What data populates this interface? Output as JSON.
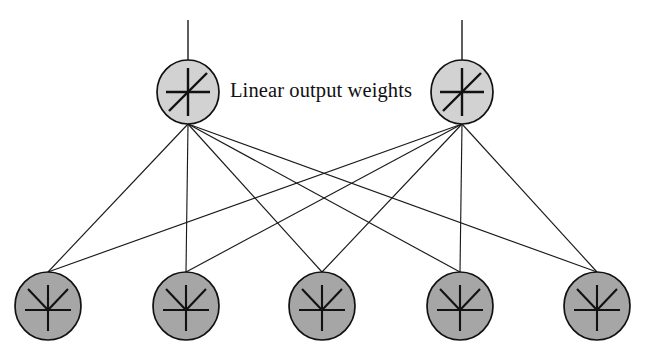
{
  "figure": {
    "title": "Linear output weights",
    "type": "neural-network-diagram",
    "background_color": "#ffffff",
    "line_color": "#1a1a1a"
  },
  "caption": {
    "label": "Linear output weights",
    "x": 230,
    "y": 97,
    "font_size_px": 20.5
  },
  "layers": [
    {
      "name": "output-layer",
      "role": "Linear output units",
      "glyph": "linear-activation-icon",
      "glyph_description": "cross with rising diagonal",
      "fill_color": "#d2d2d2",
      "stroke_color": "#111111",
      "radius_x": 31,
      "radius_y": 32,
      "center_y": 92,
      "nodes": [
        {
          "id": "out-1",
          "label": "",
          "cx": 188,
          "cy": 92
        },
        {
          "id": "out-2",
          "label": "",
          "cx": 462,
          "cy": 92
        }
      ]
    },
    {
      "name": "hidden-layer",
      "role": "Nonlinear basis function units",
      "glyph": "basis-function-icon",
      "glyph_description": "cross with V-shaped bump curve",
      "fill_color": "#a6a6a6",
      "stroke_color": "#111111",
      "radius_x": 33,
      "radius_y": 34,
      "center_y": 306,
      "nodes": [
        {
          "id": "hid-1",
          "label": "",
          "cx": 48,
          "cy": 306
        },
        {
          "id": "hid-2",
          "label": "",
          "cx": 186,
          "cy": 306
        },
        {
          "id": "hid-3",
          "label": "",
          "cx": 322,
          "cy": 306
        },
        {
          "id": "hid-4",
          "label": "",
          "cx": 460,
          "cy": 306
        },
        {
          "id": "hid-5",
          "label": "",
          "cx": 597,
          "cy": 306
        }
      ]
    }
  ],
  "stems": [
    {
      "id": "stem-out-1",
      "x": 188,
      "y_top": 20,
      "y_bottom": 60
    },
    {
      "id": "stem-out-2",
      "x": 462,
      "y_top": 20,
      "y_bottom": 60
    }
  ],
  "fan_vertices": [
    {
      "for_node": "out-1",
      "x": 188,
      "y": 124
    },
    {
      "for_node": "out-2",
      "x": 462,
      "y": 124
    }
  ],
  "connections": [
    {
      "from": "out-1",
      "to": "hid-1"
    },
    {
      "from": "out-1",
      "to": "hid-2"
    },
    {
      "from": "out-1",
      "to": "hid-3"
    },
    {
      "from": "out-1",
      "to": "hid-4"
    },
    {
      "from": "out-1",
      "to": "hid-5"
    },
    {
      "from": "out-2",
      "to": "hid-1"
    },
    {
      "from": "out-2",
      "to": "hid-2"
    },
    {
      "from": "out-2",
      "to": "hid-3"
    },
    {
      "from": "out-2",
      "to": "hid-4"
    },
    {
      "from": "out-2",
      "to": "hid-5"
    }
  ],
  "counts": {
    "output_units": 2,
    "hidden_units": 5,
    "connections": 10
  }
}
